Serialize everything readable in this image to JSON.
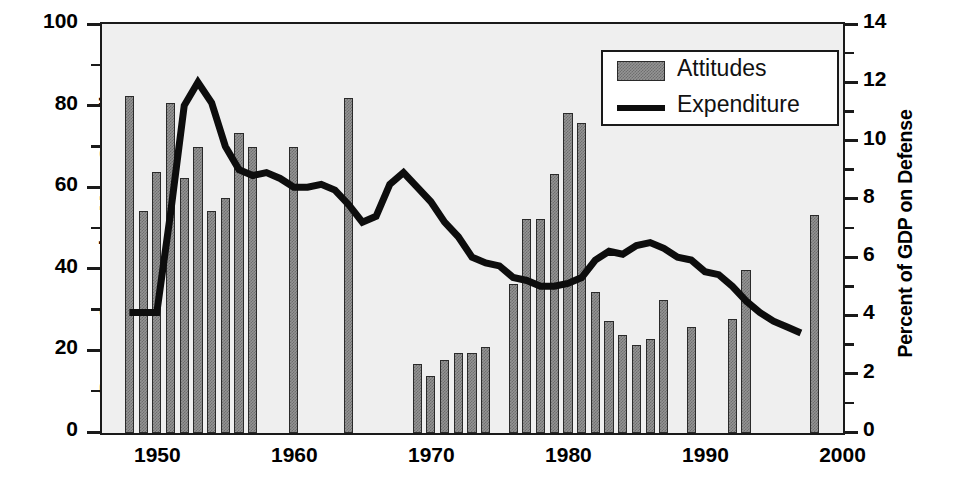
{
  "chart_data": {
    "type": "bar",
    "title": "",
    "xlabel": "",
    "ylabel": "Percent Supporting More Spending",
    "y2label": "Percent of GDP on Defense",
    "xlim": [
      1946,
      2000
    ],
    "ylim": [
      0,
      100
    ],
    "y2lim": [
      0,
      14
    ],
    "xticks": [
      "1950",
      "1960",
      "1970",
      "1980",
      "1990",
      "2000"
    ],
    "xtick_values": [
      1950,
      1960,
      1970,
      1980,
      1990,
      2000
    ],
    "yticks": [
      "0",
      "20",
      "40",
      "60",
      "80",
      "100"
    ],
    "ytick_values": [
      0,
      20,
      40,
      60,
      80,
      100
    ],
    "y2ticks": [
      "0",
      "2",
      "4",
      "6",
      "8",
      "10",
      "12",
      "14"
    ],
    "y2tick_values": [
      0,
      2,
      4,
      6,
      8,
      10,
      12,
      14
    ],
    "grid": false,
    "legend_position": "top-right",
    "series": [
      {
        "name": "Attitudes",
        "type": "bar",
        "axis": "left",
        "unit": "Percent Supporting More Spending",
        "points": [
          {
            "x": 1948,
            "y": 82.5
          },
          {
            "x": 1949,
            "y": 54.5
          },
          {
            "x": 1950,
            "y": 64.0
          },
          {
            "x": 1951,
            "y": 81.0
          },
          {
            "x": 1952,
            "y": 62.5
          },
          {
            "x": 1953,
            "y": 70.0
          },
          {
            "x": 1954,
            "y": 54.5
          },
          {
            "x": 1955,
            "y": 57.5
          },
          {
            "x": 1956,
            "y": 73.5
          },
          {
            "x": 1957,
            "y": 70.0
          },
          {
            "x": 1960,
            "y": 70.0
          },
          {
            "x": 1964,
            "y": 82.0
          },
          {
            "x": 1969,
            "y": 17.0
          },
          {
            "x": 1970,
            "y": 14.0
          },
          {
            "x": 1971,
            "y": 18.0
          },
          {
            "x": 1972,
            "y": 19.5
          },
          {
            "x": 1973,
            "y": 19.5
          },
          {
            "x": 1974,
            "y": 21.0
          },
          {
            "x": 1976,
            "y": 36.5
          },
          {
            "x": 1977,
            "y": 52.5
          },
          {
            "x": 1978,
            "y": 52.5
          },
          {
            "x": 1979,
            "y": 63.5
          },
          {
            "x": 1980,
            "y": 78.5
          },
          {
            "x": 1981,
            "y": 76.0
          },
          {
            "x": 1982,
            "y": 34.5
          },
          {
            "x": 1983,
            "y": 27.5
          },
          {
            "x": 1984,
            "y": 24.0
          },
          {
            "x": 1985,
            "y": 21.5
          },
          {
            "x": 1986,
            "y": 23.0
          },
          {
            "x": 1987,
            "y": 32.5
          },
          {
            "x": 1989,
            "y": 26.0
          },
          {
            "x": 1992,
            "y": 28.0
          },
          {
            "x": 1993,
            "y": 40.0
          },
          {
            "x": 1998,
            "y": 53.5
          }
        ]
      },
      {
        "name": "Expenditure",
        "type": "line",
        "axis": "right",
        "unit": "Percent of GDP on Defense",
        "points": [
          {
            "x": 1948,
            "y": 4.1
          },
          {
            "x": 1949,
            "y": 4.1
          },
          {
            "x": 1950,
            "y": 4.1
          },
          {
            "x": 1951,
            "y": 7.5
          },
          {
            "x": 1952,
            "y": 11.2
          },
          {
            "x": 1953,
            "y": 12.0
          },
          {
            "x": 1954,
            "y": 11.3
          },
          {
            "x": 1955,
            "y": 9.8
          },
          {
            "x": 1956,
            "y": 9.0
          },
          {
            "x": 1957,
            "y": 8.8
          },
          {
            "x": 1958,
            "y": 8.9
          },
          {
            "x": 1959,
            "y": 8.7
          },
          {
            "x": 1960,
            "y": 8.4
          },
          {
            "x": 1961,
            "y": 8.4
          },
          {
            "x": 1962,
            "y": 8.5
          },
          {
            "x": 1963,
            "y": 8.3
          },
          {
            "x": 1964,
            "y": 7.8
          },
          {
            "x": 1965,
            "y": 7.2
          },
          {
            "x": 1966,
            "y": 7.4
          },
          {
            "x": 1967,
            "y": 8.5
          },
          {
            "x": 1968,
            "y": 8.9
          },
          {
            "x": 1969,
            "y": 8.4
          },
          {
            "x": 1970,
            "y": 7.9
          },
          {
            "x": 1971,
            "y": 7.2
          },
          {
            "x": 1972,
            "y": 6.7
          },
          {
            "x": 1973,
            "y": 6.0
          },
          {
            "x": 1974,
            "y": 5.8
          },
          {
            "x": 1975,
            "y": 5.7
          },
          {
            "x": 1976,
            "y": 5.3
          },
          {
            "x": 1977,
            "y": 5.2
          },
          {
            "x": 1978,
            "y": 5.0
          },
          {
            "x": 1979,
            "y": 5.0
          },
          {
            "x": 1980,
            "y": 5.1
          },
          {
            "x": 1981,
            "y": 5.3
          },
          {
            "x": 1982,
            "y": 5.9
          },
          {
            "x": 1983,
            "y": 6.2
          },
          {
            "x": 1984,
            "y": 6.1
          },
          {
            "x": 1985,
            "y": 6.4
          },
          {
            "x": 1986,
            "y": 6.5
          },
          {
            "x": 1987,
            "y": 6.3
          },
          {
            "x": 1988,
            "y": 6.0
          },
          {
            "x": 1989,
            "y": 5.9
          },
          {
            "x": 1990,
            "y": 5.5
          },
          {
            "x": 1991,
            "y": 5.4
          },
          {
            "x": 1992,
            "y": 5.0
          },
          {
            "x": 1993,
            "y": 4.5
          },
          {
            "x": 1994,
            "y": 4.1
          },
          {
            "x": 1995,
            "y": 3.8
          },
          {
            "x": 1996,
            "y": 3.6
          },
          {
            "x": 1997,
            "y": 3.4
          }
        ]
      }
    ]
  },
  "legend": {
    "items": [
      {
        "label": "Attitudes",
        "marker": "bar-swatch",
        "color": "#949494"
      },
      {
        "label": "Expenditure",
        "marker": "line-swatch",
        "color": "#0d0d0d"
      }
    ]
  },
  "colors": {
    "bar_fill": "#949494",
    "bar_hatch": "#6e6e6e",
    "bar_border": "#2a2a2a",
    "line": "#0d0d0d",
    "plot_background": "#efefef",
    "axis": "#1a1a1a",
    "text": "#000000",
    "page_background": "#ffffff"
  }
}
